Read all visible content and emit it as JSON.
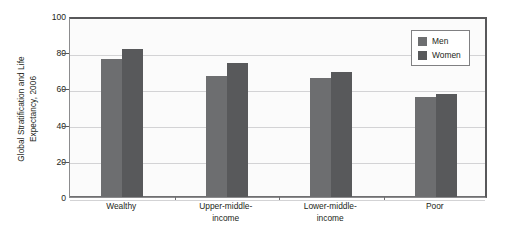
{
  "chart_data": {
    "type": "bar",
    "title": "",
    "subtitle": "",
    "xlabel": "",
    "ylabel": "Global Stratification and Life Expectancy, 2006",
    "ylabel_lines": [
      "Global Stratification and Life",
      "Expectancy, 2006"
    ],
    "categories": [
      "Wealthy",
      "Upper-middle-income",
      "Lower-middle-income",
      "Poor"
    ],
    "category_lines": [
      [
        "Wealthy"
      ],
      [
        "Upper-middle-",
        "income"
      ],
      [
        "Lower-middle-",
        "income"
      ],
      [
        "Poor"
      ]
    ],
    "series": [
      {
        "name": "Men",
        "color": "#6d6e70",
        "values": [
          76,
          67,
          66,
          55
        ]
      },
      {
        "name": "Women",
        "color": "#58595b",
        "values": [
          82,
          74,
          69,
          57
        ]
      }
    ],
    "ylim": [
      0,
      100
    ],
    "yticks": [
      0,
      20,
      40,
      60,
      80,
      100
    ],
    "ytick_labels": [
      "0",
      "20",
      "40",
      "60",
      "80",
      "100"
    ],
    "grid": true,
    "grid_axis": "y",
    "legend_position": "top-right",
    "legend_entries": [
      "Men",
      "Women"
    ],
    "plot_background": "#fbfbfb",
    "frame_color": "#58585a"
  }
}
